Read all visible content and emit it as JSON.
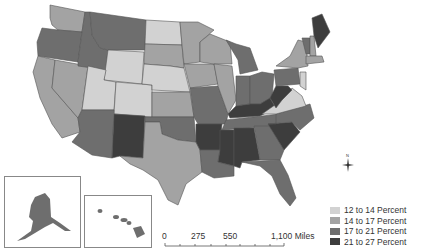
{
  "legend": {
    "items": [
      {
        "label": "12 to 14 Percent",
        "color": "#d2d2d2"
      },
      {
        "label": "14 to 17 Percent",
        "color": "#a3a3a3"
      },
      {
        "label": "17 to 21 Percent",
        "color": "#6e6e6e"
      },
      {
        "label": "21 to 27 Percent",
        "color": "#3d3d3d"
      }
    ]
  },
  "scale_bar": {
    "labels": [
      "0",
      "275",
      "550",
      "1,100 Miles"
    ]
  },
  "compass": {
    "north_label": "N"
  },
  "insets": [
    "Alaska",
    "Hawaii"
  ],
  "states": {
    "WA": "#a3a3a3",
    "OR": "#6e6e6e",
    "CA": "#a3a3a3",
    "NV": "#a3a3a3",
    "ID": "#6e6e6e",
    "MT": "#6e6e6e",
    "WY": "#d2d2d2",
    "UT": "#d2d2d2",
    "CO": "#d2d2d2",
    "AZ": "#6e6e6e",
    "NM": "#3d3d3d",
    "ND": "#d2d2d2",
    "SD": "#a3a3a3",
    "NE": "#d2d2d2",
    "KS": "#a3a3a3",
    "OK": "#6e6e6e",
    "TX": "#a3a3a3",
    "MN": "#a3a3a3",
    "IA": "#a3a3a3",
    "MO": "#6e6e6e",
    "AR": "#3d3d3d",
    "LA": "#6e6e6e",
    "WI": "#a3a3a3",
    "IL": "#a3a3a3",
    "MI": "#6e6e6e",
    "IN": "#6e6e6e",
    "OH": "#6e6e6e",
    "KY": "#3d3d3d",
    "TN": "#6e6e6e",
    "MS": "#3d3d3d",
    "AL": "#3d3d3d",
    "GA": "#6e6e6e",
    "FL": "#6e6e6e",
    "SC": "#3d3d3d",
    "NC": "#6e6e6e",
    "VA": "#d2d2d2",
    "WV": "#3d3d3d",
    "PA": "#6e6e6e",
    "NY": "#a3a3a3",
    "ME": "#3d3d3d",
    "VT": "#6e6e6e",
    "NH": "#a3a3a3",
    "MA": "#a3a3a3",
    "NJ": "#d2d2d2",
    "AK": "#6e6e6e",
    "HI": "#6e6e6e"
  }
}
